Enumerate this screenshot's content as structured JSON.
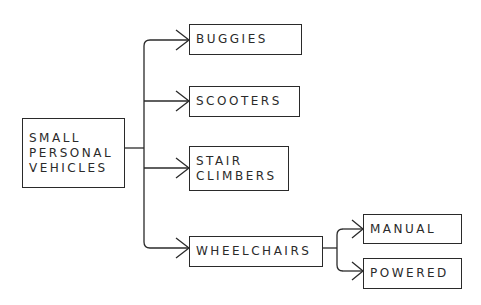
{
  "diagram": {
    "type": "tree",
    "root": {
      "id": "root",
      "lines": [
        "SMALL",
        "PERSONAL",
        "VEHICLES"
      ]
    },
    "children": [
      {
        "id": "buggies",
        "lines": [
          "BUGGIES"
        ]
      },
      {
        "id": "scooters",
        "lines": [
          "SCOOTERS"
        ]
      },
      {
        "id": "stair-climbers",
        "lines": [
          "STAIR",
          "CLIMBERS"
        ]
      },
      {
        "id": "wheelchairs",
        "lines": [
          "WHEELCHAIRS"
        ],
        "children": [
          {
            "id": "manual",
            "lines": [
              "MANUAL"
            ]
          },
          {
            "id": "powered",
            "lines": [
              "POWERED"
            ]
          }
        ]
      }
    ],
    "line_color": "#2a2a2a"
  }
}
